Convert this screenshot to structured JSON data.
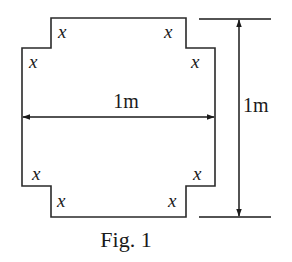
{
  "figure": {
    "caption": "Fig. 1",
    "shape": "square sheet with square cutouts of side x at each corner",
    "width_label": "1m",
    "height_label": "1m",
    "corner_variable": "x",
    "corner_labels": [
      {
        "position": "top-left-upper",
        "text": "x"
      },
      {
        "position": "top-left-lower",
        "text": "x"
      },
      {
        "position": "top-right-upper",
        "text": "x"
      },
      {
        "position": "top-right-lower",
        "text": "x"
      },
      {
        "position": "bottom-left-upper",
        "text": "x"
      },
      {
        "position": "bottom-left-lower",
        "text": "x"
      },
      {
        "position": "bottom-right-upper",
        "text": "x"
      },
      {
        "position": "bottom-right-lower",
        "text": "x"
      }
    ]
  }
}
